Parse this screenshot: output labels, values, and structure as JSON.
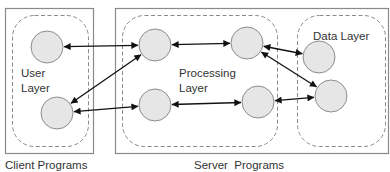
{
  "diagram": {
    "colors": {
      "box_stroke": "#8a8a8a",
      "dashed_stroke": "#8a8a8a",
      "node_fill": "#e6e6e6",
      "node_stroke": "#8c8c8c",
      "arrow": "#111111",
      "text": "#333333"
    },
    "containers": [
      {
        "id": "client",
        "label": "Client Programs",
        "x": 5,
        "y": 8,
        "w": 88,
        "h": 145
      },
      {
        "id": "server",
        "label": "Server  Programs",
        "x": 115,
        "y": 8,
        "w": 273,
        "h": 145
      }
    ],
    "layers": [
      {
        "id": "user",
        "label_lines": [
          "User",
          "Layer"
        ],
        "x": 12,
        "y": 15,
        "w": 76,
        "h": 131,
        "r": 22
      },
      {
        "id": "processing",
        "label_lines": [
          "Processing",
          "Layer"
        ],
        "x": 122,
        "y": 15,
        "w": 155,
        "h": 131,
        "r": 22
      },
      {
        "id": "data",
        "label_lines": [
          "Data Layer"
        ],
        "x": 297,
        "y": 15,
        "w": 88,
        "h": 131,
        "r": 22
      }
    ],
    "nodes": [
      {
        "id": "u1",
        "layer": "user",
        "cx": 47,
        "cy": 47,
        "r": 16
      },
      {
        "id": "u2",
        "layer": "user",
        "cx": 57,
        "cy": 113,
        "r": 16
      },
      {
        "id": "p1",
        "layer": "processing",
        "cx": 155,
        "cy": 45,
        "r": 16
      },
      {
        "id": "p2",
        "layer": "processing",
        "cx": 247,
        "cy": 43,
        "r": 16
      },
      {
        "id": "p3",
        "layer": "processing",
        "cx": 155,
        "cy": 105,
        "r": 16
      },
      {
        "id": "p4",
        "layer": "processing",
        "cx": 258,
        "cy": 102,
        "r": 16
      },
      {
        "id": "d1",
        "layer": "data",
        "cx": 319,
        "cy": 57,
        "r": 16
      },
      {
        "id": "d2",
        "layer": "data",
        "cx": 331,
        "cy": 96,
        "r": 16
      }
    ],
    "edges": [
      {
        "from": "u1",
        "to": "p1",
        "bidirectional": true
      },
      {
        "from": "p1",
        "to": "u2",
        "bidirectional": true
      },
      {
        "from": "u2",
        "to": "p3",
        "bidirectional": true
      },
      {
        "from": "p1",
        "to": "p2",
        "bidirectional": true
      },
      {
        "from": "p3",
        "to": "p4",
        "bidirectional": true
      },
      {
        "from": "p2",
        "to": "d1",
        "bidirectional": true
      },
      {
        "from": "p2",
        "to": "d2",
        "bidirectional": true
      },
      {
        "from": "p4",
        "to": "d2",
        "bidirectional": true
      }
    ]
  },
  "labels": {
    "user_layer_line1": "User",
    "user_layer_line2": "Layer",
    "processing_layer_line1": "Processing",
    "processing_layer_line2": "Layer",
    "data_layer": "Data Layer",
    "client_programs": "Client Programs",
    "server_programs": "Server  Programs"
  }
}
